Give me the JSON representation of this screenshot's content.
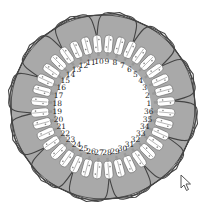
{
  "diagram": {
    "center": [
      103,
      107
    ],
    "outer_radius": 92,
    "coil_radius": 78,
    "slot_outer_radius": 72,
    "inner_radius": 50,
    "slot_count": 36,
    "first_slot_angle_deg": 5,
    "direction": "counterclockwise",
    "colors": {
      "ring": "#a9a9a9",
      "ring_stroke": "#555555",
      "slot_fill": "#ffffff",
      "coil_stroke": "#444444",
      "inner": "#ffffff",
      "label": "#222222"
    },
    "slot_labels": [
      "1",
      "2",
      "3",
      "4",
      "5",
      "6",
      "7",
      "8",
      "9",
      "10",
      "11",
      "12",
      "13",
      "14",
      "15",
      "16",
      "17",
      "18",
      "19",
      "20",
      "21",
      "22",
      "23",
      "24",
      "25",
      "26",
      "27",
      "28",
      "29",
      "30",
      "31",
      "32",
      "33",
      "34",
      "35",
      "36"
    ],
    "coil_groups": [
      {
        "from": 1,
        "to": 36,
        "span": 9
      },
      {
        "from": 4,
        "to": 9,
        "span": 9
      },
      {
        "from": 7,
        "to": 12,
        "span": 9
      },
      {
        "from": 10,
        "to": 15,
        "span": 9
      },
      {
        "from": 13,
        "to": 18,
        "span": 9
      },
      {
        "from": 16,
        "to": 21,
        "span": 9
      },
      {
        "from": 19,
        "to": 24,
        "span": 9
      },
      {
        "from": 22,
        "to": 27,
        "span": 9
      },
      {
        "from": 25,
        "to": 30,
        "span": 9
      },
      {
        "from": 28,
        "to": 33,
        "span": 9
      },
      {
        "from": 31,
        "to": 36,
        "span": 9
      },
      {
        "from": 34,
        "to": 3,
        "span": 9
      }
    ]
  },
  "cursor": {
    "icon": "mouse-pointer-icon",
    "x": 180,
    "y": 174
  }
}
